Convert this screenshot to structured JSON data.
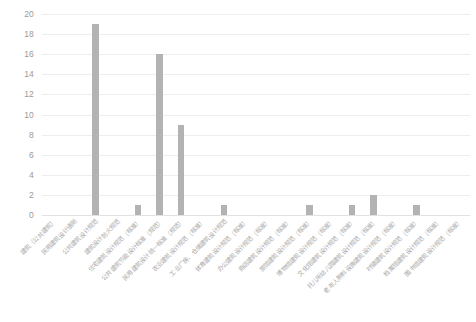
{
  "chart_data": {
    "type": "bar",
    "title": "",
    "subtitle": "",
    "xlabel": "",
    "ylabel": "",
    "ylim": [
      0,
      20
    ],
    "ytick_step": 2,
    "yticks": [
      20,
      18,
      16,
      14,
      12,
      10,
      8,
      6,
      4,
      2,
      0
    ],
    "grid": true,
    "legend": false,
    "legend_position": "none",
    "bar_color": "#b3b3b3",
    "gridline_color": "#eeeeee",
    "tick_label_color": "#9a9a9a",
    "categories": [
      "建筑（公共建筑）",
      "民用建筑设计通则",
      "公共建筑设计规范",
      "建筑设计防火规范",
      "住宅建筑设计规范（标准）",
      "公共建筑节能设计标准（规范）",
      "民用建筑设计统一标准（规范）",
      "农业建筑设计规范（标准）",
      "工业厂房、仓储建筑设计规范",
      "体育建筑设计规范（标准）",
      "办公建筑设计规范（标准）",
      "商店建筑设计规范（标准）",
      "旅馆建筑设计规范（标准）",
      "博物馆建筑设计规范（标准）",
      "文化馆建筑设计规范（标准）",
      "托儿所幼儿园建筑设计规范（标准）",
      "老年人照料设施建筑设计规范（标准）",
      "村镇建筑设计规范（标准）",
      "档案馆建筑设计规范（标准）",
      "图书馆建筑设计规范（标准）"
    ],
    "values": [
      0,
      0,
      19,
      0,
      1,
      16,
      9,
      0,
      1,
      0,
      0,
      0,
      1,
      0,
      1,
      2,
      0,
      1,
      0,
      0
    ]
  }
}
